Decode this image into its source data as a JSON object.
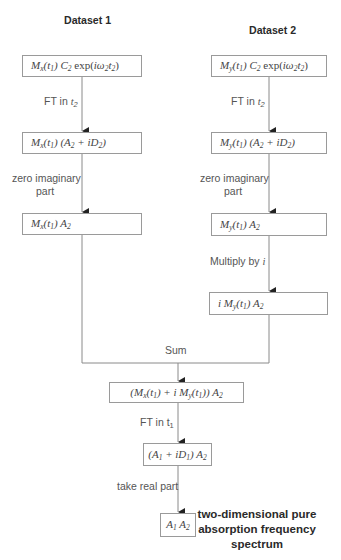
{
  "headings": {
    "dataset1": "Dataset 1",
    "dataset2": "Dataset 2"
  },
  "left_column": {
    "box1": "Mx(t1) C2 exp(iω2t2)",
    "step1": "FT in t2",
    "box2": "Mx(t1) (A2 + iD2)",
    "step2": "zero imaginary part",
    "box3": "Mx(t1) A2"
  },
  "right_column": {
    "box1": "My(t1) C2 exp(iω2t2)",
    "step1": "FT in t2",
    "box2": "My(t1) (A2 + iD2)",
    "step2": "zero imaginary part",
    "box3": "My(t1) A2",
    "step3": "Multiply by i",
    "box4": "i My(t1) A2"
  },
  "merge": {
    "sum_label": "Sum",
    "box_sum": "(Mx(t1) + i My(t1)) A2",
    "step_ft": "FT in t1",
    "box_ft": "(A1 + iD1) A2",
    "step_real": "take real part",
    "box_final": "A1 A2"
  },
  "final_label": {
    "line1": "two-dimensional pure",
    "line2": "absorption frequency",
    "line3": "spectrum"
  },
  "colors": {
    "line": "#8a8a8a",
    "box_border": "#9a9a9a",
    "text": "#444444",
    "arrow": "#222222"
  }
}
